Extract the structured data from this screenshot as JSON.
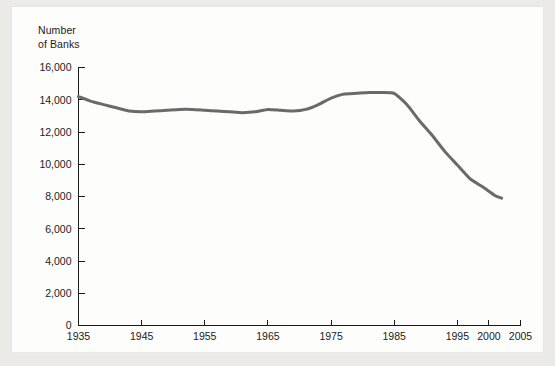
{
  "chart_data": {
    "type": "line",
    "title": "",
    "ylabel": "Number\nof Banks",
    "xlabel": "",
    "ylim": [
      0,
      16000
    ],
    "xlim": [
      1935,
      2005
    ],
    "grid": false,
    "legend": null,
    "line_color": "#6a6a6a",
    "line_width": 3,
    "y_ticks": [
      0,
      2000,
      4000,
      6000,
      8000,
      10000,
      12000,
      14000,
      16000
    ],
    "y_tick_labels": [
      "0",
      "2,000",
      "4,000",
      "6,000",
      "8,000",
      "10,000",
      "12,000",
      "14,000",
      "16,000"
    ],
    "x_ticks": [
      1935,
      1945,
      1955,
      1965,
      1975,
      1985,
      1995,
      2000,
      2005
    ],
    "x_tick_labels": [
      "1935",
      "1945",
      "1955",
      "1965",
      "1975",
      "1985",
      "1995",
      "2000",
      "2005"
    ],
    "series": [
      {
        "name": "Number of Banks",
        "x": [
          1935,
          1937,
          1939,
          1941,
          1943,
          1945,
          1947,
          1949,
          1951,
          1953,
          1955,
          1957,
          1959,
          1961,
          1963,
          1965,
          1967,
          1969,
          1971,
          1973,
          1975,
          1977,
          1979,
          1981,
          1983,
          1985,
          1987,
          1989,
          1991,
          1993,
          1995,
          1997,
          1999,
          2001,
          2002
        ],
        "values": [
          14200,
          13900,
          13700,
          13500,
          13300,
          13250,
          13300,
          13350,
          13400,
          13400,
          13350,
          13300,
          13250,
          13200,
          13250,
          13400,
          13350,
          13300,
          13400,
          13700,
          14100,
          14350,
          14400,
          14450,
          14450,
          14400,
          13700,
          12700,
          11800,
          10800,
          9950,
          9100,
          8600,
          8050,
          7900
        ]
      }
    ]
  },
  "axis": {
    "y_title_line1": "Number",
    "y_title_line2": "of Banks"
  }
}
